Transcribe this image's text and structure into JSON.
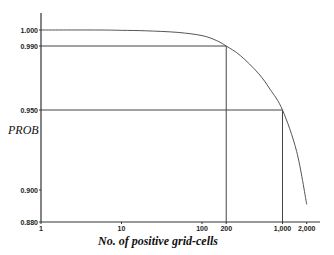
{
  "chart_data": {
    "type": "line",
    "title": "",
    "xlabel": "No. of positive grid-cells",
    "ylabel": "PROB",
    "x_scale": "log",
    "xlim": [
      1,
      3000
    ],
    "ylim": [
      0.88,
      1.008
    ],
    "x_ticks": [
      {
        "value": 1,
        "label": "1"
      },
      {
        "value": 10,
        "label": "10"
      },
      {
        "value": 100,
        "label": "100"
      },
      {
        "value": 200,
        "label": "200"
      },
      {
        "value": 1000,
        "label": "1,000"
      },
      {
        "value": 2000,
        "label": "2,000"
      }
    ],
    "y_ticks": [
      {
        "value": 1.0,
        "label": "1.000"
      },
      {
        "value": 0.99,
        "label": "0.990"
      },
      {
        "value": 0.95,
        "label": "0.950"
      },
      {
        "value": 0.9,
        "label": "0.900"
      },
      {
        "value": 0.88,
        "label": "0.880"
      }
    ],
    "grid": false,
    "legend": null,
    "series": [
      {
        "name": "PROB",
        "x": [
          1,
          5,
          10,
          20,
          50,
          100,
          150,
          200,
          300,
          500,
          700,
          1000,
          1500,
          2000
        ],
        "y": [
          1.0,
          1.0,
          0.9998,
          0.9995,
          0.9985,
          0.9965,
          0.9935,
          0.99,
          0.984,
          0.973,
          0.963,
          0.95,
          0.924,
          0.891
        ]
      }
    ],
    "annotations": [
      {
        "type": "reference-lines",
        "x": 200,
        "y": 0.99,
        "text": "N=200 gives PROB 0.990"
      },
      {
        "type": "reference-lines",
        "x": 1000,
        "y": 0.95,
        "text": "N=1,000 gives PROB 0.950"
      }
    ]
  }
}
